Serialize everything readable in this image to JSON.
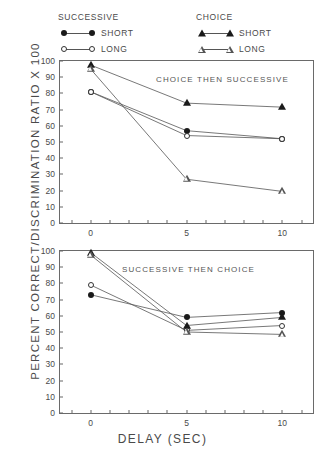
{
  "legend": {
    "groups": [
      {
        "title": "SUCCESSIVE",
        "entries": [
          {
            "label": "SHORT",
            "marker": "filled-circle"
          },
          {
            "label": "LONG",
            "marker": "open-circle"
          }
        ]
      },
      {
        "title": "CHOICE",
        "entries": [
          {
            "label": "SHORT",
            "marker": "filled-triangle"
          },
          {
            "label": "LONG",
            "marker": "open-triangle"
          }
        ]
      }
    ]
  },
  "axis": {
    "ylabel": "PERCENT CORRECT/DISCRIMINATION RATIO X 100",
    "xlabel": "DELAY (SEC)",
    "yticks": [
      100,
      90,
      80,
      70,
      60,
      50,
      40,
      30,
      20,
      10,
      0
    ],
    "xticks": [
      0,
      5,
      10
    ]
  },
  "chart_data": [
    {
      "type": "line",
      "title": "CHOICE THEN SUCCESSIVE",
      "panel": "top",
      "xlabel": "DELAY (SEC)",
      "ylabel": "PERCENT CORRECT/DISCRIMINATION RATIO X 100",
      "x": [
        0,
        5,
        10
      ],
      "xlim": [
        -1.6,
        11.6
      ],
      "ylim": [
        0,
        100
      ],
      "grid": false,
      "legend_position": "above-plot",
      "series": [
        {
          "name": "SUCCESSIVE SHORT",
          "marker": "filled-circle",
          "values": [
            81,
            57,
            52
          ]
        },
        {
          "name": "SUCCESSIVE LONG",
          "marker": "open-circle",
          "values": [
            81,
            54,
            52
          ]
        },
        {
          "name": "CHOICE SHORT",
          "marker": "filled-triangle",
          "values": [
            97.5,
            74,
            71.5
          ]
        },
        {
          "name": "CHOICE LONG",
          "marker": "open-triangle",
          "values": [
            95,
            27,
            19.5
          ]
        }
      ]
    },
    {
      "type": "line",
      "title": "SUCCESSIVE THEN CHOICE",
      "panel": "bottom",
      "xlabel": "DELAY (SEC)",
      "ylabel": "PERCENT CORRECT/DISCRIMINATION RATIO X 100",
      "x": [
        0,
        5,
        10
      ],
      "xlim": [
        -1.6,
        11.6
      ],
      "ylim": [
        0,
        100
      ],
      "grid": false,
      "legend_position": "above-plot",
      "series": [
        {
          "name": "SUCCESSIVE SHORT",
          "marker": "filled-circle",
          "values": [
            73,
            59,
            62
          ]
        },
        {
          "name": "SUCCESSIVE LONG",
          "marker": "open-circle",
          "values": [
            79,
            51,
            54
          ]
        },
        {
          "name": "CHOICE SHORT",
          "marker": "filled-triangle",
          "values": [
            99,
            54,
            59
          ]
        },
        {
          "name": "CHOICE LONG",
          "marker": "open-triangle",
          "values": [
            97.5,
            50,
            48.5
          ]
        }
      ]
    }
  ]
}
